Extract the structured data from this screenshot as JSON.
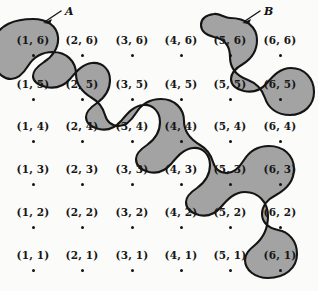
{
  "figure": {
    "background_color": "#fbfbf9",
    "blob_fill_color": "#a3a3a3",
    "blob_stroke_color": "#141414",
    "dot_color": "#131313",
    "text_color": "#161616"
  },
  "grid": {
    "columns": [
      1,
      2,
      3,
      4,
      5,
      6
    ],
    "rows": [
      6,
      5,
      4,
      3,
      2,
      1
    ],
    "column_x": [
      33,
      82,
      132,
      181,
      230,
      280
    ],
    "row_y": [
      41,
      85,
      127,
      170,
      213,
      256
    ],
    "cells": [
      {
        "label": "(1, 6)",
        "x": 1,
        "y": 6,
        "col_px": 33,
        "row_px": 41,
        "in_region": "A"
      },
      {
        "label": "(2, 6)",
        "x": 2,
        "y": 6,
        "col_px": 82,
        "row_px": 41,
        "in_region": ""
      },
      {
        "label": "(3, 6)",
        "x": 3,
        "y": 6,
        "col_px": 132,
        "row_px": 41,
        "in_region": ""
      },
      {
        "label": "(4, 6)",
        "x": 4,
        "y": 6,
        "col_px": 181,
        "row_px": 41,
        "in_region": ""
      },
      {
        "label": "(5, 6)",
        "x": 5,
        "y": 6,
        "col_px": 230,
        "row_px": 41,
        "in_region": "B"
      },
      {
        "label": "(6, 6)",
        "x": 6,
        "y": 6,
        "col_px": 280,
        "row_px": 41,
        "in_region": ""
      },
      {
        "label": "(1, 5)",
        "x": 1,
        "y": 5,
        "col_px": 33,
        "row_px": 85,
        "in_region": ""
      },
      {
        "label": "(2, 5)",
        "x": 2,
        "y": 5,
        "col_px": 82,
        "row_px": 85,
        "in_region": "A"
      },
      {
        "label": "(3, 5)",
        "x": 3,
        "y": 5,
        "col_px": 132,
        "row_px": 85,
        "in_region": ""
      },
      {
        "label": "(4, 5)",
        "x": 4,
        "y": 5,
        "col_px": 181,
        "row_px": 85,
        "in_region": ""
      },
      {
        "label": "(5, 5)",
        "x": 5,
        "y": 5,
        "col_px": 230,
        "row_px": 85,
        "in_region": ""
      },
      {
        "label": "(6, 5)",
        "x": 6,
        "y": 5,
        "col_px": 280,
        "row_px": 85,
        "in_region": "B"
      },
      {
        "label": "(1, 4)",
        "x": 1,
        "y": 4,
        "col_px": 33,
        "row_px": 127,
        "in_region": ""
      },
      {
        "label": "(2, 4)",
        "x": 2,
        "y": 4,
        "col_px": 82,
        "row_px": 127,
        "in_region": ""
      },
      {
        "label": "(3, 4)",
        "x": 3,
        "y": 4,
        "col_px": 132,
        "row_px": 127,
        "in_region": "A"
      },
      {
        "label": "(4, 4)",
        "x": 4,
        "y": 4,
        "col_px": 181,
        "row_px": 127,
        "in_region": ""
      },
      {
        "label": "(5, 4)",
        "x": 5,
        "y": 4,
        "col_px": 230,
        "row_px": 127,
        "in_region": ""
      },
      {
        "label": "(6, 4)",
        "x": 6,
        "y": 4,
        "col_px": 280,
        "row_px": 127,
        "in_region": ""
      },
      {
        "label": "(1, 3)",
        "x": 1,
        "y": 3,
        "col_px": 33,
        "row_px": 170,
        "in_region": ""
      },
      {
        "label": "(2, 3)",
        "x": 2,
        "y": 3,
        "col_px": 82,
        "row_px": 170,
        "in_region": ""
      },
      {
        "label": "(3, 3)",
        "x": 3,
        "y": 3,
        "col_px": 132,
        "row_px": 170,
        "in_region": ""
      },
      {
        "label": "(4, 3)",
        "x": 4,
        "y": 3,
        "col_px": 181,
        "row_px": 170,
        "in_region": "A"
      },
      {
        "label": "(5, 3)",
        "x": 5,
        "y": 3,
        "col_px": 230,
        "row_px": 170,
        "in_region": ""
      },
      {
        "label": "(6, 3)",
        "x": 6,
        "y": 3,
        "col_px": 280,
        "row_px": 170,
        "in_region": ""
      },
      {
        "label": "(1, 2)",
        "x": 1,
        "y": 2,
        "col_px": 33,
        "row_px": 213,
        "in_region": ""
      },
      {
        "label": "(2, 2)",
        "x": 2,
        "y": 2,
        "col_px": 82,
        "row_px": 213,
        "in_region": ""
      },
      {
        "label": "(3, 2)",
        "x": 3,
        "y": 2,
        "col_px": 132,
        "row_px": 213,
        "in_region": ""
      },
      {
        "label": "(4, 2)",
        "x": 4,
        "y": 2,
        "col_px": 181,
        "row_px": 213,
        "in_region": ""
      },
      {
        "label": "(5, 2)",
        "x": 5,
        "y": 2,
        "col_px": 230,
        "row_px": 213,
        "in_region": "A"
      },
      {
        "label": "(6, 2)",
        "x": 6,
        "y": 2,
        "col_px": 280,
        "row_px": 213,
        "in_region": ""
      },
      {
        "label": "(1, 1)",
        "x": 1,
        "y": 1,
        "col_px": 33,
        "row_px": 256,
        "in_region": ""
      },
      {
        "label": "(2, 1)",
        "x": 2,
        "y": 1,
        "col_px": 82,
        "row_px": 256,
        "in_region": ""
      },
      {
        "label": "(3, 1)",
        "x": 3,
        "y": 1,
        "col_px": 132,
        "row_px": 256,
        "in_region": ""
      },
      {
        "label": "(4, 1)",
        "x": 4,
        "y": 1,
        "col_px": 181,
        "row_px": 256,
        "in_region": ""
      },
      {
        "label": "(5, 1)",
        "x": 5,
        "y": 1,
        "col_px": 230,
        "row_px": 256,
        "in_region": ""
      },
      {
        "label": "(6, 1)",
        "x": 6,
        "y": 1,
        "col_px": 280,
        "row_px": 256,
        "in_region": "A"
      }
    ]
  },
  "regions": [
    {
      "id": "A",
      "letter": "A",
      "letter_x": 65,
      "letter_y": 6,
      "members": [
        "(1, 6)",
        "(2, 5)",
        "(3, 4)",
        "(4, 3)",
        "(5, 2)",
        "(6, 1)"
      ],
      "description": "long serpentine band along the anti-diagonal"
    },
    {
      "id": "B",
      "letter": "B",
      "letter_x": 264,
      "letter_y": 6,
      "members": [
        "(5, 6)",
        "(6, 5)"
      ],
      "description": "small peanut-shaped blob"
    }
  ]
}
